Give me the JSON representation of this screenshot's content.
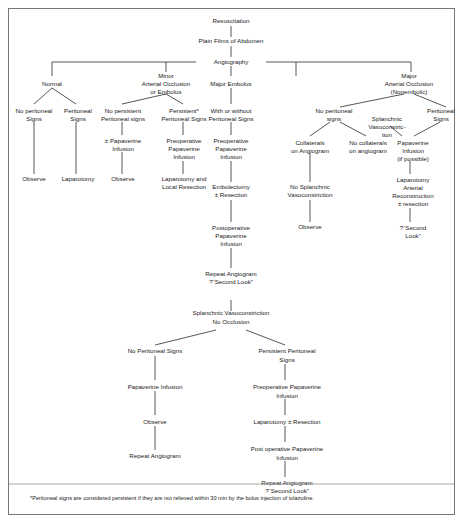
{
  "figure": {
    "footnote": "*Peritoneal signs are considered persistent if they are not relieved within 30 min by the bolus injection of tolazoline."
  },
  "nodes": {
    "resuscitation": "Resuscitation",
    "plain_films": "Plain Films of Abdomen",
    "angiography": "Angiography",
    "normal": "Normal",
    "minor_occlusion_l1": "Minor",
    "minor_occlusion_l2": "Arterial Occlusion",
    "minor_occlusion_l3": "or Embolus",
    "major_embolus": "Major Embolus",
    "major_occlusion_l1": "Major",
    "major_occlusion_l2": "Arterial Occlusion",
    "major_occlusion_l3": "(Nonembolic)",
    "no_perit_signs_a_l1": "No peritoneal",
    "no_perit_signs_a_l2": "Signs",
    "perit_signs_a_l1": "Peritoneal",
    "perit_signs_a_l2": "Signs",
    "no_persist_perit_l1": "No persistent",
    "no_persist_perit_l2": "Peritoneal signs",
    "persist_perit_l1": "Persistent*",
    "persist_perit_l2": "Peritoneal Signs",
    "with_without_l1": "With or without",
    "with_without_l2": "Peritoneal Signs",
    "no_perit_signs_b_l1": "No peritoneal",
    "no_perit_signs_b_l2": "signs",
    "splanchnic_vaso_l1": "Splanchnic",
    "splanchnic_vaso_l2": "Vasoconstric-",
    "splanchnic_vaso_l3": "tion",
    "perit_signs_b_l1": "Peritoneal",
    "perit_signs_b_l2": "Signs",
    "observe_1": "Observe",
    "laparotomy_1": "Laparotomy",
    "pap_infusion_opt_l1": "± Papaverine",
    "pap_infusion_opt_l2": "Infusion",
    "observe_2": "Observe",
    "preop_pap_a_l1": "Preoperative",
    "preop_pap_a_l2": "Papaverine",
    "preop_pap_a_l3": "Infusion",
    "lap_local_resect_l1": "Laparotomy and",
    "lap_local_resect_l2": "Local Resection",
    "preop_pap_b_l1": "Preoperative",
    "preop_pap_b_l2": "Papaverine",
    "preop_pap_b_l3": "Infusion",
    "embolectomy_l1": "Embolectomy",
    "embolectomy_l2": "± Resection",
    "postop_pap_l1": "Postoperative",
    "postop_pap_l2": "Papaverine",
    "postop_pap_l3": "Infusion",
    "repeat_angio_1_l1": "Repeat Angiogram",
    "repeat_angio_1_l2": "?“Second Look”",
    "collaterals_l1": "Collaterals",
    "collaterals_l2": "on Angiogram",
    "no_splanchnic_l1": "No Splanchnic",
    "no_splanchnic_l2": "Vasoconstriction",
    "observe_3": "Observe",
    "no_collaterals_l1": "No collaterals",
    "no_collaterals_l2": "on angiogram",
    "pap_if_possible_l1": "Papaverine",
    "pap_if_possible_l2": "Infusion",
    "pap_if_possible_l3": "(if possible)",
    "lap_arterial_l1": "Laparotomy",
    "lap_arterial_l2": "Arterial",
    "lap_arterial_l3": "Reconstruction",
    "lap_arterial_l4": "± resection",
    "second_look_1_l1": "?“Second",
    "second_look_1_l2": "Look”",
    "splanchnic_noocc_l1": "Splanchnic Vasoconstriction",
    "splanchnic_noocc_l2": "No Occlusion",
    "no_perit_signs_c": "No Peritoneal Signs",
    "persist_perit_c_l1": "Persistent Peritoneal",
    "persist_perit_c_l2": "Signs",
    "pap_infusion_c": "Papaverine Infusion",
    "observe_4": "Observe",
    "repeat_angio_2": "Repeat Angiogram",
    "preop_pap_c_l1": "Preoperative Papaverine",
    "preop_pap_c_l2": "Infusion",
    "lap_resection_c": "Laparotomy ± Resection",
    "postop_pap_c_l1": "Post operative Papaverine",
    "postop_pap_c_l2": "Infusion",
    "repeat_angio_3_l1": "Repeat Angiogram",
    "repeat_angio_3_l2": "?“Second Look”"
  },
  "colors": {
    "text": "#1a1a1a",
    "edge": "#2b2b2b",
    "border": "#777777",
    "background": "#ffffff"
  }
}
